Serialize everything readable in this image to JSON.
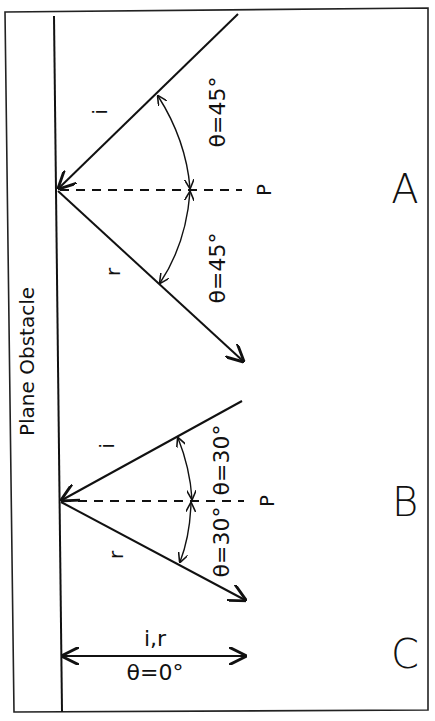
{
  "diagram": {
    "obstacle_label": "Plane Obstacle",
    "panels": [
      {
        "id": "A",
        "label": "A",
        "incident_label": "i",
        "reflected_label": "r",
        "normal_label": "P",
        "angle_incident_label": "θ=45°",
        "angle_reflected_label": "θ=45°"
      },
      {
        "id": "B",
        "label": "B",
        "incident_label": "i",
        "reflected_label": "r",
        "normal_label": "P",
        "angle_incident_label": "θ=30°",
        "angle_reflected_label": "θ=30°"
      },
      {
        "id": "C",
        "label": "C",
        "combined_label": "i,r",
        "angle_label": "θ=0°"
      }
    ]
  }
}
